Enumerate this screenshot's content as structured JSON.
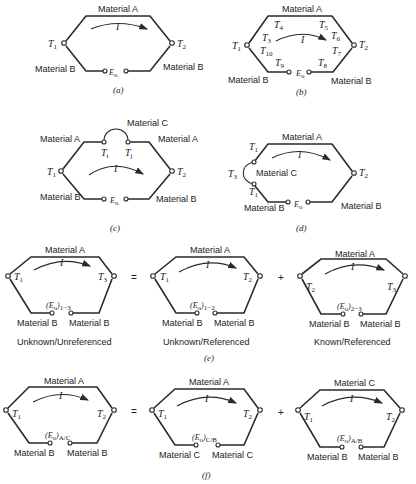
{
  "figure": {
    "a": {
      "caption": "(a)",
      "top_material": "Material A",
      "left_material": "Material B",
      "right_material": "Material B",
      "current": "I",
      "t_left": "T",
      "t_left_sub": "1",
      "t_right": "T",
      "t_right_sub": "2",
      "emf": "E",
      "emf_sub": "o"
    },
    "b": {
      "caption": "(b)",
      "top_material": "Material A",
      "left_material": "Material B",
      "right_material": "Material B",
      "current": "I",
      "t_left": "T",
      "t_left_sub": "1",
      "t_right": "T",
      "t_right_sub": "2",
      "emf": "E",
      "emf_sub": "o",
      "gradient_labels": [
        {
          "t": "T",
          "sub": "3"
        },
        {
          "t": "T",
          "sub": "4"
        },
        {
          "t": "T",
          "sub": "5"
        },
        {
          "t": "T",
          "sub": "6"
        },
        {
          "t": "T",
          "sub": "7"
        },
        {
          "t": "T",
          "sub": "8"
        },
        {
          "t": "T",
          "sub": "9"
        },
        {
          "t": "T",
          "sub": "10"
        }
      ]
    },
    "c": {
      "caption": "(c)",
      "insert_material": "Material C",
      "top_left_material": "Material A",
      "top_right_material": "Material A",
      "left_material": "Material B",
      "right_material": "Material B",
      "current": "I",
      "t_left": "T",
      "t_left_sub": "1",
      "t_right": "T",
      "t_right_sub": "2",
      "ti": "T",
      "ti_sub": "i",
      "tj": "T",
      "tj_sub": "j",
      "emf": "E",
      "emf_sub": "o"
    },
    "d": {
      "caption": "(d)",
      "top_material": "Material A",
      "insert_material": "Material C",
      "left_material": "Material B",
      "right_material": "Material B",
      "current": "I",
      "t_upper": "T",
      "t_upper_sub": "1",
      "t_lower": "T",
      "t_lower_sub": "1",
      "t_loop": "T",
      "t_loop_sub": "3",
      "t_right": "T",
      "t_right_sub": "2",
      "emf": "E",
      "emf_sub": "o"
    },
    "e": {
      "caption": "(e)",
      "equals": "=",
      "plus": "+",
      "panels": [
        {
          "top_material": "Material A",
          "left_material": "Material B",
          "right_material": "Material B",
          "current": "I",
          "t_left": "T",
          "t_left_sub": "1",
          "t_right": "T",
          "t_right_sub": "3",
          "emf": "(E",
          "emf_sub_o": "o",
          "emf_close": ")",
          "emf_sub": "1−3",
          "note": "Unknown/Unreferenced"
        },
        {
          "top_material": "Material A",
          "left_material": "Material B",
          "right_material": "Material B",
          "current": "I",
          "t_left": "T",
          "t_left_sub": "1",
          "t_right": "T",
          "t_right_sub": "2",
          "emf": "(E",
          "emf_sub_o": "o",
          "emf_close": ")",
          "emf_sub": "1−2",
          "note": "Unknown/Referenced"
        },
        {
          "top_material": "Material A",
          "left_material": "Material B",
          "right_material": "Material B",
          "current": "I",
          "t_left": "T",
          "t_left_sub": "2",
          "t_right": "T",
          "t_right_sub": "3",
          "emf": "(E",
          "emf_sub_o": "o",
          "emf_close": ")",
          "emf_sub": "2−3",
          "note": "Known/Referenced"
        }
      ]
    },
    "f": {
      "caption": "(f)",
      "equals": "=",
      "plus": "+",
      "panels": [
        {
          "top_material": "Material A",
          "left_material": "Material B",
          "right_material": "Material B",
          "current": "I",
          "t_left": "T",
          "t_left_sub": "1",
          "t_right": "T",
          "t_right_sub": "2",
          "emf": "(E",
          "emf_sub_o": "o",
          "emf_close": ")",
          "emf_sub": "A/C"
        },
        {
          "top_material": "Material A",
          "left_material": "Material C",
          "right_material": "Material C",
          "current": "I",
          "t_left": "T",
          "t_left_sub": "1",
          "t_right": "T",
          "t_right_sub": "2",
          "emf": "(E",
          "emf_sub_o": "o",
          "emf_close": ")",
          "emf_sub": "C/B"
        },
        {
          "top_material": "Material C",
          "left_material": "Material B",
          "right_material": "Material B",
          "current": "I",
          "t_left": "T",
          "t_left_sub": "1",
          "t_right": "T",
          "t_right_sub": "2",
          "emf": "(E",
          "emf_sub_o": "o",
          "emf_close": ")",
          "emf_sub": "A/B"
        }
      ]
    }
  }
}
